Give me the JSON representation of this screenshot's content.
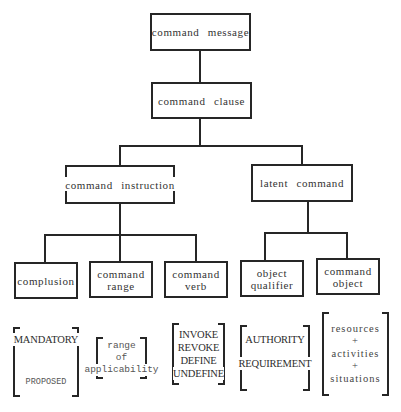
{
  "diagram": {
    "line_color": "#262626",
    "nodes": {
      "root": {
        "label": "command message"
      },
      "clause": {
        "label": "command clause"
      },
      "instruction": {
        "label": "command instruction"
      },
      "latent": {
        "label": "latent command"
      },
      "complusion": {
        "label": "complusion"
      },
      "range": {
        "line1": "command",
        "line2": "range"
      },
      "verb": {
        "line1": "command",
        "line2": "verb"
      },
      "qualifier": {
        "line1": "object",
        "line2": "qualifier"
      },
      "object": {
        "line1": "command",
        "line2": "object"
      }
    },
    "edges": [
      [
        "command message",
        "command clause"
      ],
      [
        "command clause",
        "command instruction"
      ],
      [
        "command clause",
        "latent command"
      ],
      [
        "command instruction",
        "complusion"
      ],
      [
        "command instruction",
        "command range"
      ],
      [
        "command instruction",
        "command verb"
      ],
      [
        "latent command",
        "object qualifier"
      ],
      [
        "latent command",
        "command object"
      ]
    ],
    "value_sets": {
      "complusion": [
        "MANDATORY",
        "PROPOSED"
      ],
      "range": [
        "range",
        "of",
        "applicability"
      ],
      "verb": [
        "INVOKE",
        "REVOKE",
        "DEFINE",
        "UNDEFINE"
      ],
      "qualifier": [
        "AUTHORITY",
        "REQUIREMENT"
      ],
      "object": [
        "resources",
        "+",
        "activities",
        "+",
        "situations"
      ]
    }
  }
}
